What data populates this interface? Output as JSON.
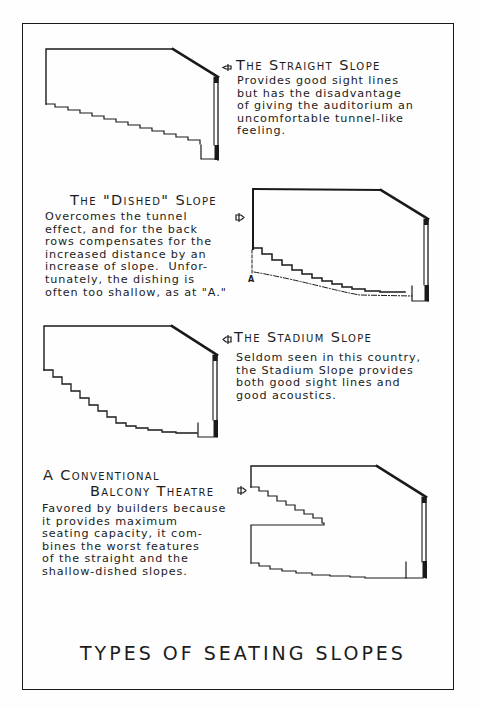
{
  "page_title": "TYPES OF SEATING SLOPES",
  "panels": [
    {
      "id": "straight",
      "heading": "The Straight Slope",
      "description": "Provides good sight lines\nbut has the disadvantage\nof giving the auditorium an\nuncomfortable tunnel-like\nfeeling."
    },
    {
      "id": "dished",
      "heading": "The \"Dished\" Slope",
      "description": "Overcomes the tunnel\neffect, and for the back\nrows compensates for the\nincreased distance by an\nincrease of slope.  Unfor-\ntunately, the dishing is\noften too shallow, as at \"A.\"",
      "marker_label": "A"
    },
    {
      "id": "stadium",
      "heading": "The Stadium Slope",
      "description": "Seldom seen in this country,\nthe Stadium Slope provides\nboth good sight lines and\ngood acoustics."
    },
    {
      "id": "balcony",
      "heading_line1": "A Conventional",
      "heading_line2": "Balcony Theatre",
      "description": "Favored by builders because\nit provides maximum\nseating capacity, it com-\nbines the worst features\nof the straight and the\nshallow-dished slopes."
    }
  ],
  "icons": {
    "pointer": "arrow-pointer-icon"
  },
  "colors": {
    "ink": "#1a1a1a",
    "paper": "#fefefe"
  }
}
